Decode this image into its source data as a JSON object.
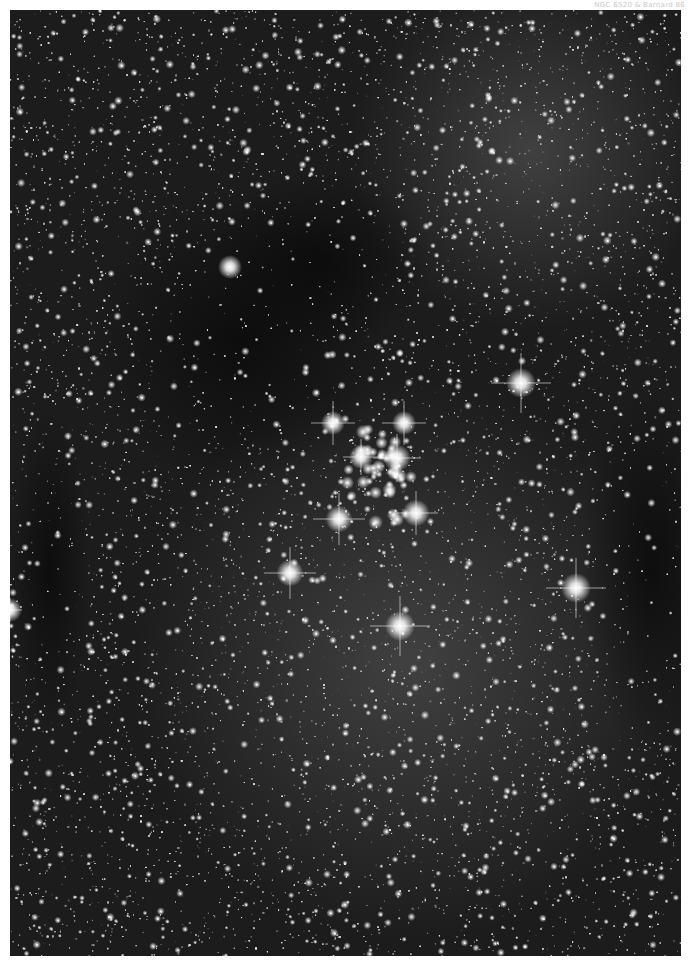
{
  "caption": "NGC 6520 & Barnard 86",
  "photo": {
    "subject": "open star cluster with dark nebulae in Milky Way star field",
    "background_color": "#1c1c1c",
    "bright_stars": [
      {
        "x": 323,
        "y": 413,
        "r": 4,
        "spike": 22
      },
      {
        "x": 394,
        "y": 413,
        "r": 4,
        "spike": 22
      },
      {
        "x": 351,
        "y": 447,
        "r": 4,
        "spike": 18
      },
      {
        "x": 387,
        "y": 448,
        "r": 4.5,
        "spike": 24
      },
      {
        "x": 329,
        "y": 509,
        "r": 4.5,
        "spike": 26
      },
      {
        "x": 406,
        "y": 503,
        "r": 4.5,
        "spike": 22
      },
      {
        "x": 511,
        "y": 373,
        "r": 5,
        "spike": 30
      },
      {
        "x": 280,
        "y": 563,
        "r": 4.5,
        "spike": 26
      },
      {
        "x": 566,
        "y": 578,
        "r": 5,
        "spike": 30
      },
      {
        "x": 390,
        "y": 616,
        "r": 5,
        "spike": 30
      },
      {
        "x": 220,
        "y": 257,
        "r": 4,
        "spike": 0
      },
      {
        "x": 0,
        "y": 600,
        "r": 4,
        "spike": 12
      }
    ],
    "cluster_core": {
      "x": 370,
      "y": 465,
      "count": 40,
      "spread": 45
    },
    "dark_nebulae": [
      {
        "x": 230,
        "y": 330,
        "rx": 150,
        "ry": 150
      },
      {
        "x": 310,
        "y": 250,
        "rx": 110,
        "ry": 90
      },
      {
        "x": 640,
        "y": 560,
        "rx": 70,
        "ry": 180
      },
      {
        "x": 40,
        "y": 560,
        "rx": 40,
        "ry": 160
      }
    ],
    "bright_regions": [
      {
        "x": 400,
        "y": 650,
        "rx": 280,
        "ry": 260
      },
      {
        "x": 520,
        "y": 140,
        "rx": 180,
        "ry": 140
      }
    ]
  }
}
